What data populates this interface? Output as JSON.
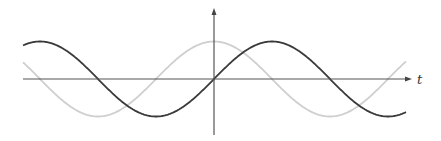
{
  "chart_data": {
    "type": "line",
    "title": "",
    "xlabel": "t",
    "ylabel": "",
    "grid": false,
    "legend": null,
    "x_range_periods": [
      -0.82,
      0.83
    ],
    "ylim": [
      -1,
      1
    ],
    "series": [
      {
        "name": "sin(t)",
        "style": "dark",
        "color": "#3a3a3a",
        "function": "sin",
        "phase": 0
      },
      {
        "name": "cos(t)",
        "style": "light",
        "color": "#cfcfcf",
        "function": "cos",
        "phase": 0
      }
    ],
    "x": [
      -1.64,
      -1.5,
      -1.0,
      -0.5,
      0,
      0.5,
      1.0,
      1.5,
      1.66
    ],
    "x_units": "multiples of pi"
  },
  "axes": {
    "x_label": "t",
    "origin_px": [
      214,
      79
    ],
    "x_start_px": 23,
    "x_end_px": 412,
    "y_top_px": 8,
    "y_bottom_px": 135
  },
  "geometry": {
    "period_px": 232,
    "amplitude_px": 37.5,
    "curve_x_start": 23,
    "curve_x_end": 406
  }
}
